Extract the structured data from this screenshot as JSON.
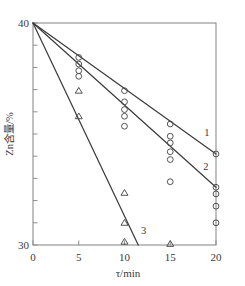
{
  "figure": {
    "background": "#ffffff",
    "line_color": "#3d3d3d",
    "axis_color": "#8d8d8d",
    "marker_color": "#4a4a4a"
  },
  "axes": {
    "x_title": "τ/min",
    "y_title": "Zn含量/%",
    "x_ticks": [
      "0",
      "5",
      "10",
      "15",
      "20"
    ],
    "y_ticks": [
      "30",
      "40"
    ],
    "x_min": 0,
    "x_max": 20,
    "y_min": 30,
    "y_max": 40
  },
  "curve_labels": {
    "one": "1",
    "two": "2",
    "three": "3"
  },
  "chart_data": {
    "type": "scatter",
    "title": "",
    "xlabel": "τ/min",
    "ylabel": "Zn含量/%",
    "xlim": [
      0,
      20
    ],
    "ylim": [
      30,
      40
    ],
    "grid": false,
    "legend": "none",
    "x_ticks": [
      0,
      5,
      10,
      15,
      20
    ],
    "y_ticks": [
      30,
      40
    ],
    "y_minor_tick_interval": 1,
    "annotations": [
      {
        "text": "1",
        "x": 19.0,
        "y": 34.9
      },
      {
        "text": "2",
        "x": 18.9,
        "y": 33.4
      },
      {
        "text": "3",
        "x": 12.1,
        "y": 30.5
      }
    ],
    "series": [
      {
        "name": "1",
        "marker": "circle",
        "fit_line": {
          "x": [
            0,
            20
          ],
          "y": [
            40.0,
            34.1
          ]
        },
        "points": [
          {
            "x": 5,
            "y": 38.45
          },
          {
            "x": 10,
            "y": 36.95
          },
          {
            "x": 10,
            "y": 36.45
          },
          {
            "x": 15,
            "y": 35.45
          },
          {
            "x": 20,
            "y": 34.1
          }
        ]
      },
      {
        "name": "2",
        "marker": "circle",
        "fit_line": {
          "x": [
            0,
            20
          ],
          "y": [
            40.0,
            32.6
          ]
        },
        "points": [
          {
            "x": 5,
            "y": 38.15
          },
          {
            "x": 5,
            "y": 37.85
          },
          {
            "x": 5,
            "y": 37.6
          },
          {
            "x": 10,
            "y": 36.1
          },
          {
            "x": 10,
            "y": 35.8
          },
          {
            "x": 10,
            "y": 35.35
          },
          {
            "x": 15,
            "y": 34.9
          },
          {
            "x": 15,
            "y": 34.6
          },
          {
            "x": 15,
            "y": 34.2
          },
          {
            "x": 15,
            "y": 33.85
          },
          {
            "x": 15,
            "y": 32.85
          },
          {
            "x": 20,
            "y": 32.6
          },
          {
            "x": 20,
            "y": 32.3
          },
          {
            "x": 20,
            "y": 31.75
          },
          {
            "x": 20,
            "y": 31.0
          }
        ]
      },
      {
        "name": "3",
        "marker": "triangle",
        "fit_line": {
          "x": [
            0,
            11.5
          ],
          "y": [
            40.0,
            30.0
          ]
        },
        "points": [
          {
            "x": 5,
            "y": 36.95
          },
          {
            "x": 5,
            "y": 35.8
          },
          {
            "x": 10,
            "y": 32.35
          },
          {
            "x": 10,
            "y": 31.0
          },
          {
            "x": 10,
            "y": 30.15
          },
          {
            "x": 15,
            "y": 30.05
          }
        ]
      }
    ]
  }
}
